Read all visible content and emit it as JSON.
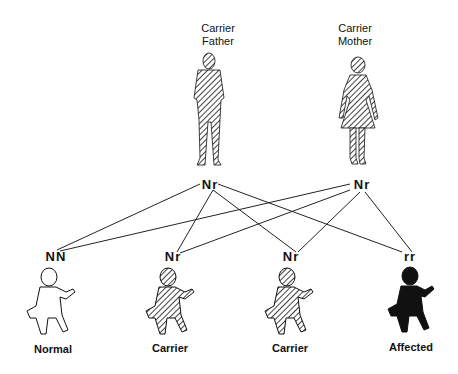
{
  "parents": [
    {
      "label_line1": "Carrier",
      "label_line2": "Father",
      "genotype": "Nr",
      "icon": "man-figure-hatched"
    },
    {
      "label_line1": "Carrier",
      "label_line2": "Mother",
      "genotype": "Nr",
      "icon": "woman-figure-hatched"
    }
  ],
  "children": [
    {
      "genotype": "NN",
      "caption": "Normal",
      "icon": "baby-figure-outline"
    },
    {
      "genotype": "Nr",
      "caption": "Carrier",
      "icon": "baby-figure-hatched"
    },
    {
      "genotype": "Nr",
      "caption": "Carrier",
      "icon": "baby-figure-hatched"
    },
    {
      "genotype": "rr",
      "caption": "Affected",
      "icon": "baby-figure-solid"
    }
  ],
  "colors": {
    "ink": "#111111",
    "background": "#ffffff"
  }
}
